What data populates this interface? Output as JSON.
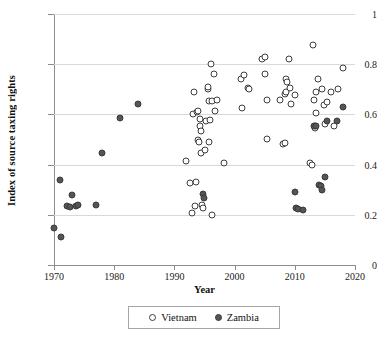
{
  "chart_data": {
    "type": "scatter",
    "title": "",
    "xlabel": "Year",
    "ylabel": "Index of source taxing rights",
    "xlim": [
      1970,
      2020
    ],
    "ylim": [
      0,
      1
    ],
    "xticks": [
      1970,
      1980,
      1990,
      2000,
      2010,
      2020
    ],
    "yticks": [
      0,
      0.2,
      0.4,
      0.6,
      0.8,
      1
    ],
    "xtick_labels": [
      "1970",
      "1980",
      "1990",
      "2000",
      "2010",
      "2020"
    ],
    "ytick_labels": [
      "0",
      "0.2",
      "0.4",
      "0.6",
      "0.8",
      "1"
    ],
    "grid": "horizontal",
    "legend_position": "bottom",
    "colors": {
      "vietnam_marker_fill": "#ffffff",
      "vietnam_marker_edge": "#3d3d3d",
      "zambia_marker_fill": "#555555",
      "zambia_marker_edge": "#3a3a3a",
      "gridline": "#d9d9d9",
      "axis": "#8c8c8c"
    },
    "series": [
      {
        "name": "Vietnam",
        "marker": "open-circle",
        "points": [
          [
            1992.0,
            0.415
          ],
          [
            1992.6,
            0.325
          ],
          [
            1992.9,
            0.207
          ],
          [
            1993.1,
            0.602
          ],
          [
            1993.3,
            0.688
          ],
          [
            1993.5,
            0.234
          ],
          [
            1993.6,
            0.33
          ],
          [
            1993.8,
            0.611
          ],
          [
            1993.9,
            0.615
          ],
          [
            1994.0,
            0.5
          ],
          [
            1994.1,
            0.489
          ],
          [
            1994.2,
            0.58
          ],
          [
            1994.3,
            0.553
          ],
          [
            1994.4,
            0.533
          ],
          [
            1994.5,
            0.446
          ],
          [
            1994.6,
            0.24
          ],
          [
            1994.7,
            0.228
          ],
          [
            1995.1,
            0.46
          ],
          [
            1995.3,
            0.573
          ],
          [
            1995.5,
            0.7
          ],
          [
            1995.6,
            0.711
          ],
          [
            1995.7,
            0.655
          ],
          [
            1995.8,
            0.49
          ],
          [
            1995.9,
            0.576
          ],
          [
            1996.0,
            0.802
          ],
          [
            1996.2,
            0.654
          ],
          [
            1996.3,
            0.199
          ],
          [
            1996.6,
            0.762
          ],
          [
            1996.8,
            0.614
          ],
          [
            1997.0,
            0.657
          ],
          [
            1998.3,
            0.405
          ],
          [
            2001.0,
            0.742
          ],
          [
            2001.3,
            0.625
          ],
          [
            2001.6,
            0.755
          ],
          [
            2002.2,
            0.705
          ],
          [
            2002.4,
            0.7
          ],
          [
            2004.5,
            0.822
          ],
          [
            2005.0,
            0.828
          ],
          [
            2005.0,
            0.76
          ],
          [
            2005.3,
            0.657
          ],
          [
            2005.4,
            0.503
          ],
          [
            2007.6,
            0.657
          ],
          [
            2008.0,
            0.482
          ],
          [
            2008.3,
            0.488
          ],
          [
            2008.4,
            0.68
          ],
          [
            2008.5,
            0.69
          ],
          [
            2008.6,
            0.742
          ],
          [
            2008.7,
            0.73
          ],
          [
            2009.0,
            0.822
          ],
          [
            2009.2,
            0.705
          ],
          [
            2009.4,
            0.643
          ],
          [
            2010.0,
            0.678
          ],
          [
            2012.6,
            0.407
          ],
          [
            2012.8,
            0.398
          ],
          [
            2013.0,
            0.875
          ],
          [
            2013.2,
            0.657
          ],
          [
            2013.3,
            0.545
          ],
          [
            2013.4,
            0.553
          ],
          [
            2013.5,
            0.604
          ],
          [
            2013.6,
            0.69
          ],
          [
            2013.8,
            0.742
          ],
          [
            2014.5,
            0.7
          ],
          [
            2014.8,
            0.638
          ],
          [
            2015.0,
            0.56
          ],
          [
            2015.4,
            0.648
          ],
          [
            2016.0,
            0.69
          ],
          [
            2016.5,
            0.553
          ],
          [
            2017.2,
            0.7
          ],
          [
            2018.0,
            0.783
          ]
        ]
      },
      {
        "name": "Zambia",
        "marker": "filled-circle",
        "points": [
          [
            1970.0,
            0.146
          ],
          [
            1971.0,
            0.337
          ],
          [
            1971.2,
            0.11
          ],
          [
            1972.2,
            0.234
          ],
          [
            1972.7,
            0.233
          ],
          [
            1973.0,
            0.28
          ],
          [
            1973.6,
            0.237
          ],
          [
            1974.0,
            0.24
          ],
          [
            1977.0,
            0.238
          ],
          [
            1978.0,
            0.447
          ],
          [
            1981.0,
            0.586
          ],
          [
            1984.0,
            0.64
          ],
          [
            1994.8,
            0.284
          ],
          [
            1994.9,
            0.267
          ],
          [
            2010.0,
            0.292
          ],
          [
            2010.2,
            0.226
          ],
          [
            2010.5,
            0.224
          ],
          [
            2011.4,
            0.22
          ],
          [
            2013.2,
            0.555
          ],
          [
            2013.5,
            0.553
          ],
          [
            2014.0,
            0.32
          ],
          [
            2014.3,
            0.313
          ],
          [
            2014.6,
            0.3
          ],
          [
            2015.0,
            0.35
          ],
          [
            2015.4,
            0.573
          ],
          [
            2017.0,
            0.575
          ],
          [
            2018.0,
            0.63
          ]
        ]
      }
    ]
  },
  "legend": {
    "items": [
      {
        "label": "Vietnam",
        "marker": "open-circle"
      },
      {
        "label": "Zambia",
        "marker": "filled-circle"
      }
    ]
  }
}
